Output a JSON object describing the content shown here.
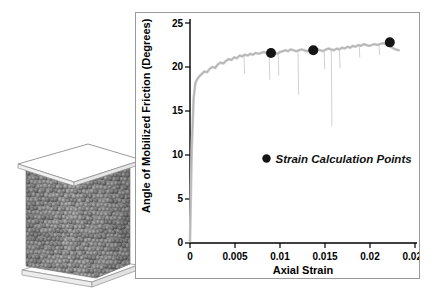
{
  "figure": {
    "panels": [
      {
        "name": "specimen-illustration",
        "description": "3D DEM particle column specimen"
      },
      {
        "name": "friction-angle-chart",
        "description": "Angle of mobilized friction vs axial strain"
      }
    ]
  },
  "specimen": {
    "particle_color": "#7d7d7d",
    "platen_color": "#fcfcfc",
    "outline_color": "#8c8c8c"
  },
  "chart_data": {
    "type": "line",
    "title": "",
    "xlabel": "Axial Strain",
    "ylabel": "Angle of Mobilized Friction (Degrees)",
    "xlim": [
      0,
      0.025
    ],
    "ylim": [
      0,
      25
    ],
    "xticks": [
      0,
      0.005,
      0.01,
      0.015,
      0.02,
      0.025
    ],
    "xticklabels": [
      "0",
      "0.005",
      "0.01",
      "0.015",
      "0.02",
      "0.025"
    ],
    "yticks": [
      0,
      5,
      10,
      15,
      20,
      25
    ],
    "yticklabels": [
      "0",
      "5",
      "10",
      "15",
      "20",
      "25"
    ],
    "grid": false,
    "legend_position": "inside-lower-left",
    "series": [
      {
        "name": "Mobilized friction angle",
        "style": "noisy-band",
        "color": "#c9c9c9",
        "x": [
          0.0,
          0.0002,
          0.0004,
          0.0006,
          0.0008,
          0.001,
          0.0013,
          0.0016,
          0.0019,
          0.0022,
          0.0025,
          0.0028,
          0.0031,
          0.0034,
          0.0037,
          0.004,
          0.0043,
          0.0046,
          0.0049,
          0.0052,
          0.0055,
          0.0058,
          0.0061,
          0.0064,
          0.0067,
          0.007,
          0.0073,
          0.0076,
          0.0079,
          0.0082,
          0.0085,
          0.0088,
          0.0091,
          0.0094,
          0.0097,
          0.01,
          0.0103,
          0.0106,
          0.0109,
          0.0112,
          0.0115,
          0.0118,
          0.0121,
          0.0124,
          0.0127,
          0.013,
          0.0133,
          0.0136,
          0.0139,
          0.0142,
          0.0145,
          0.0148,
          0.0151,
          0.0154,
          0.0157,
          0.016,
          0.0163,
          0.0166,
          0.0169,
          0.0172,
          0.0175,
          0.0178,
          0.0181,
          0.0184,
          0.0187,
          0.019,
          0.0193,
          0.0196,
          0.0199,
          0.0202,
          0.0205,
          0.0208,
          0.0211,
          0.0214,
          0.0217,
          0.022,
          0.0223,
          0.0226,
          0.0229,
          0.0232
        ],
        "y": [
          0.2,
          10.8,
          16.4,
          18.2,
          18.6,
          18.9,
          19.2,
          19.5,
          19.4,
          19.8,
          20.0,
          19.9,
          20.3,
          20.5,
          20.4,
          20.7,
          20.9,
          20.8,
          21.1,
          21.0,
          21.3,
          21.2,
          21.4,
          21.3,
          21.5,
          21.4,
          21.6,
          21.5,
          21.6,
          21.7,
          21.6,
          21.5,
          21.6,
          21.7,
          21.5,
          21.7,
          21.8,
          21.9,
          21.8,
          22.0,
          21.9,
          21.8,
          21.9,
          22.0,
          21.9,
          21.8,
          21.9,
          22.0,
          21.9,
          22.0,
          21.9,
          21.8,
          22.0,
          22.1,
          22.0,
          21.9,
          22.1,
          22.0,
          22.2,
          22.1,
          22.3,
          22.2,
          22.4,
          22.3,
          22.5,
          22.4,
          22.6,
          22.5,
          22.4,
          22.5,
          22.6,
          22.5,
          22.6,
          22.7,
          22.6,
          22.5,
          22.3,
          22.1,
          22.0,
          21.9
        ],
        "spikes": [
          {
            "x": 0.006,
            "top": 21.2,
            "bottom": 19.3
          },
          {
            "x": 0.0088,
            "top": 21.5,
            "bottom": 18.6
          },
          {
            "x": 0.0098,
            "top": 21.6,
            "bottom": 19.1
          },
          {
            "x": 0.012,
            "top": 21.9,
            "bottom": 16.9
          },
          {
            "x": 0.0149,
            "top": 21.9,
            "bottom": 19.8
          },
          {
            "x": 0.0157,
            "top": 22.0,
            "bottom": 13.3
          },
          {
            "x": 0.0166,
            "top": 22.0,
            "bottom": 19.9
          },
          {
            "x": 0.0188,
            "top": 22.5,
            "bottom": 21.1
          },
          {
            "x": 0.021,
            "top": 22.6,
            "bottom": 21.4
          }
        ]
      }
    ],
    "markers": {
      "name": "Strain Calculation Points",
      "color": "#151515",
      "points": [
        {
          "x": 0.009,
          "y": 21.6
        },
        {
          "x": 0.0137,
          "y": 21.9
        },
        {
          "x": 0.0222,
          "y": 22.8
        }
      ]
    },
    "legend": {
      "marker_symbol": "filled-circle",
      "label": "Strain Calculation Points",
      "x": 0.0085,
      "y": 9.6
    }
  }
}
